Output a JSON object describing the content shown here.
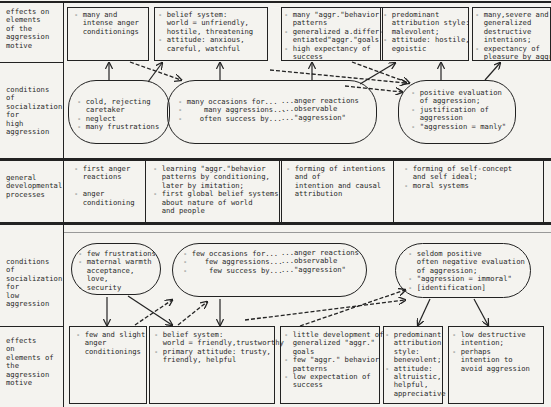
{
  "row_labels": {
    "high_effects": "effects on\nelements\nof the\naggression\nmotive",
    "high_conditions": "conditions\nof\nsocialization\nfor\nhigh\naggression",
    "general": "general\ndevelopmental\nprocesses",
    "low_conditions": "conditions\nof\nsocialization\nfor\nlow\naggression",
    "low_effects": "effects\non\nelements of\nthe\naggression\nmotive"
  },
  "high_effects": [
    "- many and\n  intense anger\n  conditionings",
    "- belief system:\n  world = unfriendly,\n  hostile, threatening\n- attitude: anxious,\n  careful, watchful",
    "- many \"aggr.\"behavior\n  patterns\n- generalized a.differ-\n  entiated\"aggr.\"goals\n- high expectancy of\n  success",
    "- predominant\n  attribution style:\n  malevolent;\n- attitude: hostile,\n  egoistic",
    "- many,severe and\n  generalized\n  destructive\n  intentions;\n- expectancy of\n  pleasure by aggr"
  ],
  "high_conditions": [
    "- cold, rejecting\n  caretaker\n- neglect\n- many frustrations",
    "- many occasions for...\n-     many aggressions...\n-    often success by...",
    "...anger reactions\n...observable\n...\"aggression\"",
    "- positive evaluation\n  of aggression;\n- justification of\n  aggression\n- \"aggression = manly\""
  ],
  "general": [
    "- first anger\n  reactions\n\n- anger\n  conditioning",
    "- learning \"aggr.\"behavior\n  patterns by conditioning,\n  later by imitation;\n- first global belief systems\n  about nature of world\n  and people",
    "- forming of intentions\n  and of\n  intention and causal\n  attribution",
    "- forming of self-concept\n  and self ideal;\n- moral systems"
  ],
  "low_conditions": [
    "- few frustrations\n- maternal warmth\n  acceptance,\n  love,\n- security",
    "- few occasions for...\n-    few aggressions...\n-     few success by...",
    "...anger reactions\n...observable\n...\"aggression\"",
    "- seldom positive\n  often negative evaluation\n  of aggression;\n- \"aggression = immoral\"\n- [identification]"
  ],
  "low_effects": [
    "- few and slight\n  anger\n  conditionings",
    "- belief system:\n  world = friendly,trustworthy\n- primary attitude: trusty,\n  friendly, helpful",
    "- little development of\n  generalized \"aggr.\"\n  goals\n- few \"aggr.\" behavior\n  patterns\n- low expectation of\n  success",
    "- predominant\n  attribution\n  style:\n  benevolent;\n- attitude:\n  altruistic,\n  helpful,\n  appreciative",
    "- low destructive\n  intention;\n- perhaps\n  intention to\n  avoid aggression"
  ]
}
